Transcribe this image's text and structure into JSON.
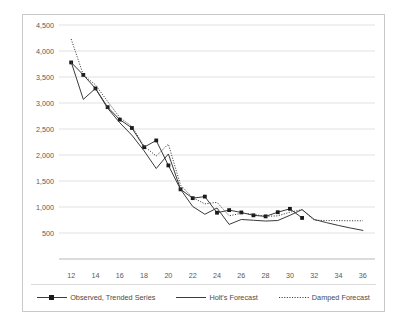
{
  "chart_data": {
    "type": "line",
    "title": "",
    "xlabel": "",
    "ylabel": "",
    "xlim": [
      11,
      37
    ],
    "ylim": [
      0,
      4500
    ],
    "grid": true,
    "grid_axis": "y",
    "legend_position": "bottom",
    "xticks": [
      12,
      14,
      16,
      18,
      20,
      22,
      24,
      26,
      28,
      30,
      32,
      34,
      36
    ],
    "xtick_labels": [
      "12",
      "14",
      "16",
      "18",
      "20",
      "22",
      "24",
      "26",
      "28",
      "30",
      "32",
      "34",
      "36"
    ],
    "yticks": [
      0,
      500,
      1000,
      1500,
      2000,
      2500,
      3000,
      3500,
      4000,
      4500
    ],
    "ytick_labels": [
      "",
      "500",
      "1,000",
      "1,500",
      "2,000",
      "2,500",
      "3,000",
      "3,500",
      "4,000",
      "4,500"
    ],
    "series": [
      {
        "name": "Observed, Trended Series",
        "style": "solid-with-markers",
        "marker": "square",
        "color": "#3a3a3a",
        "x": [
          12,
          13,
          14,
          15,
          16,
          17,
          18,
          19,
          20,
          21,
          22,
          23,
          24,
          25,
          26,
          27,
          28,
          29,
          30,
          31
        ],
        "values": [
          3780,
          3540,
          3280,
          2920,
          2680,
          2520,
          2150,
          2280,
          1800,
          1340,
          1170,
          1200,
          890,
          940,
          895,
          840,
          820,
          900,
          965,
          790
        ]
      },
      {
        "name": "Holt's Forecast",
        "style": "solid",
        "color": "#3a3a3a",
        "x": [
          12,
          13,
          14,
          15,
          16,
          17,
          18,
          19,
          20,
          21,
          22,
          23,
          24,
          25,
          26,
          27,
          28,
          29,
          30,
          31,
          32,
          33,
          34,
          35,
          36
        ],
        "values": [
          3790,
          3070,
          3280,
          2900,
          2620,
          2380,
          2080,
          1740,
          2020,
          1340,
          1010,
          860,
          980,
          665,
          760,
          745,
          730,
          740,
          840,
          950,
          760,
          700,
          645,
          595,
          550
        ]
      },
      {
        "name": "Damped Forecast",
        "style": "dotted",
        "color": "#3a3a3a",
        "x": [
          12,
          13,
          14,
          15,
          16,
          17,
          18,
          19,
          20,
          21,
          22,
          23,
          24,
          25,
          26,
          27,
          28,
          29,
          30,
          31,
          32,
          33,
          34,
          35,
          36
        ],
        "values": [
          4230,
          3540,
          3350,
          3030,
          2720,
          2550,
          2170,
          1980,
          2210,
          1420,
          1180,
          1060,
          1090,
          830,
          880,
          860,
          820,
          830,
          900,
          950,
          745,
          740,
          738,
          735,
          735
        ]
      }
    ]
  },
  "legend": {
    "items": [
      {
        "label": "Observed, Trended Series",
        "swatch": "line-square-marker"
      },
      {
        "label": "Holt's Forecast",
        "swatch": "line-solid"
      },
      {
        "label": "Damped Forecast",
        "swatch": "line-dotted"
      }
    ]
  }
}
